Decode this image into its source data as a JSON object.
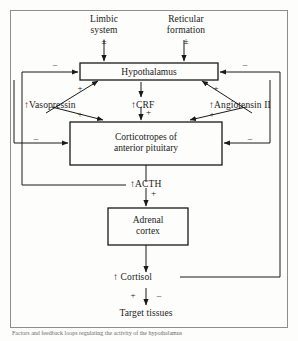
{
  "diagram": {
    "frame_color": "#8d8d8d",
    "line_color": "#1a1a1a",
    "background": "#fdfdfb"
  },
  "nodes": {
    "limbic_system": {
      "line1": "Limbic",
      "line2": "system"
    },
    "reticular_formation": {
      "line1": "Reticular",
      "line2": "formation"
    },
    "hypothalamus": {
      "label": "Hypothalamus"
    },
    "corticotropes": {
      "line1": "Corticotropes of",
      "line2": "anterior pituitary"
    },
    "adrenal_cortex": {
      "line1": "Adrenal",
      "line2": "cortex"
    },
    "target_tissues": {
      "label": "Target tissues"
    }
  },
  "mediators": {
    "vasopressin": {
      "arrow": "↑",
      "label": "Vasopressin"
    },
    "crf": {
      "arrow": "↑",
      "label": "CRF"
    },
    "angiotensin": {
      "arrow": "↑",
      "label": "Angiotensin II"
    },
    "acth": {
      "arrow": "↑",
      "label": "ACTH"
    },
    "cortisol": {
      "arrow": "↑",
      "label": "Cortisol"
    }
  },
  "signs": {
    "limbic_input": "±",
    "reticular_input": "±",
    "hypo_feedback_left": "–",
    "hypo_feedback_right": "–",
    "hypo_to_vasopressin": "+",
    "hypo_to_angiotensin": "+",
    "vasopressin_to_cort": "+",
    "crf_to_cort": "+",
    "angiotensin_to_cort": "+",
    "cort_feedback_left": "–",
    "cort_feedback_right": "–",
    "acth_to_adrenal": "+",
    "cortisol_to_target_plus": "+",
    "cortisol_to_target_minus": "–"
  },
  "caption": {
    "text": "Factors and feedback loops regulating the activity of the hypothalamus"
  }
}
